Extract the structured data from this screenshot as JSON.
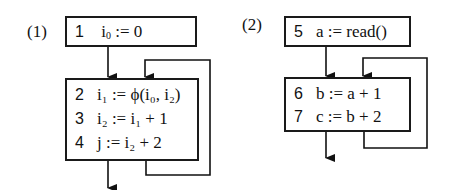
{
  "diagrams": [
    {
      "label": "(1)",
      "blocks": [
        {
          "lines": [
            {
              "num": "1",
              "pre": "i",
              "sub": "0",
              "post": " := 0"
            }
          ]
        },
        {
          "lines": [
            {
              "num": "2",
              "text": "i₁ := ϕ(i₀, i₂)"
            },
            {
              "num": "3",
              "text": "i₂ := i₁ + 1"
            },
            {
              "num": "4",
              "text": "j := i₂ + 2"
            }
          ]
        }
      ]
    },
    {
      "label": "(2)",
      "blocks": [
        {
          "lines": [
            {
              "num": "5",
              "text": "a := read()"
            }
          ]
        },
        {
          "lines": [
            {
              "num": "6",
              "text": "b := a + 1"
            },
            {
              "num": "7",
              "text": "c := b + 2"
            }
          ]
        }
      ]
    }
  ]
}
